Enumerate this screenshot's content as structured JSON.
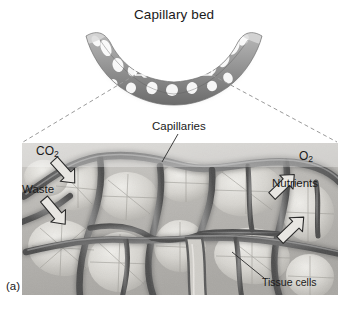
{
  "figure": {
    "panel_label": "(a)",
    "title": "Capillary bed",
    "labels": {
      "capillaries": "Capillaries",
      "co2": "CO",
      "co2_sub": "2",
      "waste": "Waste",
      "o2": "O",
      "o2_sub": "2",
      "nutrients": "Nutrients",
      "tissue_cells": "Tissue cells"
    },
    "colors": {
      "text": "#1a1a1a",
      "vessel_dark": "#4a4a4a",
      "tissue_light": "#d8d6d2",
      "background": "#ffffff",
      "dashed_guide": "#9a9a9a",
      "arrow_outline": "#2a2a2a"
    }
  },
  "diagram": {
    "type": "anatomy-illustration",
    "upper_view": "crescent-shaped capillary bed mesh with inset selection rectangle",
    "lower_view": "magnified micrograph of capillary network surrounding tissue cells",
    "exchange_inward": [
      "CO2",
      "Waste"
    ],
    "exchange_outward": [
      "O2",
      "Nutrients"
    ]
  }
}
